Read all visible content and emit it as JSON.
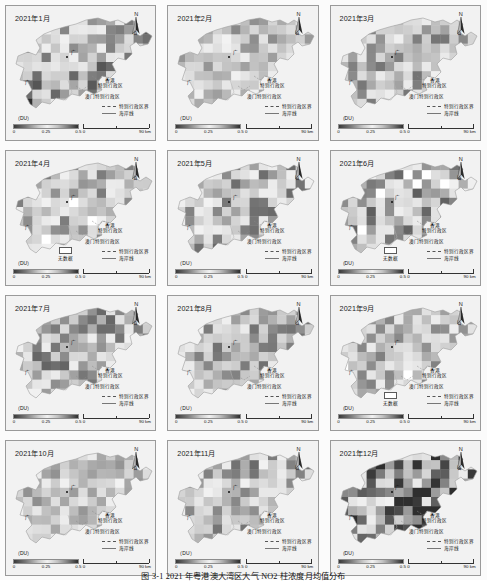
{
  "figure": {
    "caption": "图 3-1   2021 年粤港澳大湾区大气 NO2 柱浓度月均值分布",
    "rows": 4,
    "cols": 3
  },
  "common": {
    "north_label": "N",
    "colorbar": {
      "unit_label": "（DU）",
      "ticks": [
        "0",
        "0.25",
        "0.5"
      ],
      "min": 0,
      "max": 0.5,
      "ramp_hex": [
        "#3a3a3a",
        "#777777",
        "#c9c9c9",
        "#f2f2f2",
        "#c2c2c2",
        "#7d7d7d",
        "#2e2e2e"
      ]
    },
    "scalebar": {
      "start": "0",
      "end": "90 km",
      "length_km": 90
    },
    "legend_items": [
      {
        "symbol": "dashed-line",
        "label": "特别行政区界"
      },
      {
        "symbol": "solid-line",
        "label": "海岸线"
      }
    ],
    "nodata": {
      "label": "无数据",
      "color_hex": "#ffffff"
    },
    "place_labels": {
      "hongkong": "香港\n特别行政区",
      "hongkong_line1": "香港",
      "hongkong_line2": "特别行政区",
      "macao": "澳门特别行政区",
      "guangzhou": "广",
      "shenzhen": "广",
      "province": "省"
    }
  },
  "chart_data": {
    "type": "heatmap",
    "title": "2021 年粤港澳大湾区大气 NO2 柱浓度月均值分布",
    "unit": "DU",
    "value_range": [
      0,
      0.5
    ],
    "colormap": "grayscale (dark-light-dark)",
    "panels": [
      {
        "id": "m01",
        "title": "2021年1月",
        "month": 1,
        "has_nodata": false,
        "mean_du": 0.33,
        "note": "西南部出现高值（深色）斑块"
      },
      {
        "id": "m02",
        "title": "2021年2月",
        "month": 2,
        "has_nodata": false,
        "mean_du": 0.24,
        "note": "中部出现大面积低值（浅色）"
      },
      {
        "id": "m03",
        "title": "2021年3月",
        "month": 3,
        "has_nodata": false,
        "mean_du": 0.3,
        "note": "整体中高值，局部深色"
      },
      {
        "id": "m04",
        "title": "2021年4月",
        "month": 4,
        "month_label": "2021年4月",
        "has_nodata": true,
        "mean_du": 0.22,
        "note": "含无数据白色像元"
      },
      {
        "id": "m05",
        "title": "2021年5月",
        "month": 5,
        "has_nodata": false,
        "mean_du": 0.2,
        "note": "整体偏低"
      },
      {
        "id": "m06",
        "title": "2021年6月",
        "month": 6,
        "has_nodata": true,
        "mean_du": 0.18,
        "note": "西北部大片无数据"
      },
      {
        "id": "m07",
        "title": "2021年7月",
        "month": 7,
        "has_nodata": false,
        "mean_du": 0.19,
        "note": "夏季低值"
      },
      {
        "id": "m08",
        "title": "2021年8月",
        "month": 8,
        "has_nodata": false,
        "mean_du": 0.21,
        "note": "零星高值像元"
      },
      {
        "id": "m09",
        "title": "2021年9月",
        "month": 9,
        "has_nodata": true,
        "mean_du": 0.23,
        "note": "西侧含无数据像元"
      },
      {
        "id": "m10",
        "title": "2021年10月",
        "month": 10,
        "has_nodata": false,
        "mean_du": 0.27,
        "note": "中部偏低，周边中值"
      },
      {
        "id": "m11",
        "title": "2021年11月",
        "month": 11,
        "has_nodata": false,
        "mean_du": 0.31,
        "note": "整体升高"
      },
      {
        "id": "m12",
        "title": "2021年12月",
        "month": 12,
        "has_nodata": false,
        "mean_du": 0.38,
        "note": "中东部出现最高值（最深色）"
      }
    ]
  }
}
